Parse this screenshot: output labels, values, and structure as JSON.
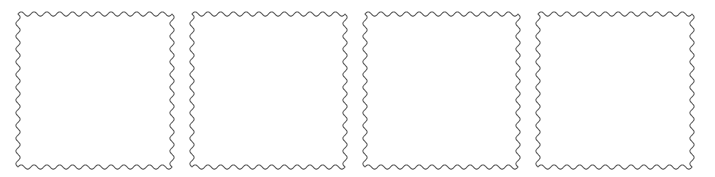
{
  "canvas": {
    "width": 715,
    "height": 177,
    "background_color": "#ffffff",
    "description": "Row of four empty square frames with wavy scalloped borders"
  },
  "style": {
    "stroke_color": "#595959",
    "fill_color": "#ffffff",
    "stroke_width": 1.05,
    "wave_amplitude": 2.1,
    "wave_period": 13.2
  },
  "frames": [
    {
      "id": "frame-1",
      "label": "Wavy square frame 1",
      "x": 18,
      "y": 14,
      "width": 154,
      "height": 153
    },
    {
      "id": "frame-2",
      "label": "Wavy square frame 2",
      "x": 192,
      "y": 14,
      "width": 153,
      "height": 153
    },
    {
      "id": "frame-3",
      "label": "Wavy square frame 3",
      "x": 365,
      "y": 14,
      "width": 153,
      "height": 153
    },
    {
      "id": "frame-4",
      "label": "Wavy square frame 4",
      "x": 538,
      "y": 14,
      "width": 154,
      "height": 153
    }
  ]
}
